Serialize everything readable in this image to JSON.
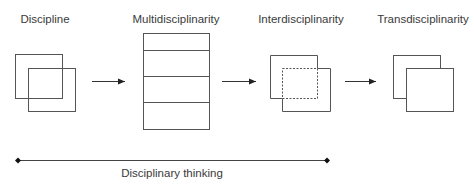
{
  "stages": [
    {
      "label": "Discipline"
    },
    {
      "label": "Multidisciplinarity"
    },
    {
      "label": "Interdisciplinarity"
    },
    {
      "label": "Transdisciplinarity"
    }
  ],
  "axis": {
    "label": "Disciplinary thinking"
  },
  "colors": {
    "stroke": "#444444",
    "text": "#3a3a3a"
  }
}
